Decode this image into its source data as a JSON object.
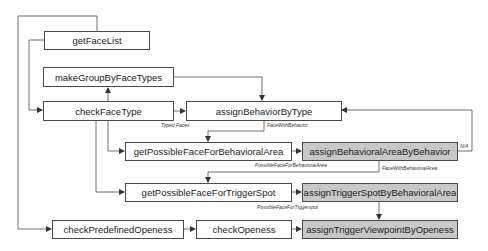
{
  "diagram": {
    "type": "flowchart",
    "nodes": {
      "getFaceList": "getFaceList",
      "makeGroupByFaceTypes": "makeGroupByFaceTypes",
      "checkFaceType": "checkFaceType",
      "assignBehaviorByType": "assignBehaviorByType",
      "getPossibleFaceForBehavioralArea": "getPossibleFaceForBehavioralArea",
      "assignBehavioralAreaByBehavior": "assignBehavioralAreaByBehavior",
      "getPossibleFaceForTriggerSpot": "getPossibleFaceForTriggerSpot",
      "assignTriggerSpotByBehavioralArea": "assignTriggerSpotByBehavioralArea",
      "checkPredefinedOpeness": "checkPredefinedOpeness",
      "checkOpeness": "checkOpeness",
      "assignTriggerViewpointByOpeness": "assignTriggerViewpointByOpeness"
    },
    "edge_labels": {
      "typed_faces": "Typed Faces",
      "face_with_behavior": "FaceWithBehavior",
      "possible_face_for_behavioral_area": "PossibleFaceForBehavioralArea",
      "face_with_behavioral_area": "FaceWithBehavioralArea",
      "possible_face_for_trigger_spot": "PossibleFaceForTiggerspot",
      "na": "N/A"
    },
    "highlight_color": "#c8c8c8",
    "line_color": "#4a4a4a"
  }
}
